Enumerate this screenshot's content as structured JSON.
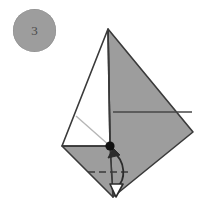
{
  "figure": {
    "type": "origami-instruction-diagram",
    "background_color": "#ffffff"
  },
  "step_badge": {
    "name": "step-number-badge",
    "number": "3",
    "fill_color": "#9d9d9d",
    "text_color": "#4a4a4a",
    "center_x": 34,
    "center_y": 30,
    "radius": 21
  },
  "colors": {
    "paper_front": "#9d9d9d",
    "paper_back": "#ffffff",
    "outline": "#3a3a3a",
    "crease_solid": "#4a4a4a",
    "crease_light": "#b0b0b0",
    "fold_dashed": "#3a3a3a",
    "arrow": "#2b2b2b",
    "point_marker": "#111111"
  },
  "geometry": {
    "apex": {
      "label": "top-vertex",
      "x": 108,
      "y": 29
    },
    "right_vertex": {
      "label": "right-vertex",
      "x": 193,
      "y": 132
    },
    "bottom_vertex": {
      "label": "bottom-vertex",
      "x": 113,
      "y": 197
    },
    "left_vertex": {
      "label": "left-vertex",
      "x": 62,
      "y": 146
    },
    "center_point": {
      "label": "center-point",
      "x": 110,
      "y": 146
    }
  },
  "shapes": {
    "gray_right_panel": {
      "name": "gray-right-panel",
      "points": "108,29 193,132 113,197 110,146"
    },
    "gray_bottom_left_panel": {
      "name": "gray-bottom-left-panel",
      "points": "62,146 110,146 113,197"
    },
    "white_left_panel": {
      "name": "white-left-panel",
      "points": "108,29 110,146 62,146"
    }
  },
  "creases": {
    "vertical_center": {
      "name": "vertical-center-crease",
      "x1": 108,
      "y1": 29,
      "x2": 110,
      "y2": 146
    },
    "horizontal_left": {
      "name": "horizontal-left-crease",
      "x1": 62,
      "y1": 146,
      "x2": 110,
      "y2": 146
    },
    "horizontal_right": {
      "name": "horizontal-right-crease",
      "x1": 113,
      "y1": 112,
      "x2": 192,
      "y2": 112
    },
    "diagonal_light": {
      "name": "diagonal-light-crease",
      "x1": 76,
      "y1": 116,
      "x2": 110,
      "y2": 146
    }
  },
  "fold_line": {
    "name": "valley-fold-dashed-line",
    "x1": 88,
    "y1": 172,
    "x2": 130,
    "y2": 172,
    "dash_pattern": "7 4"
  },
  "arrow": {
    "name": "fold-direction-arrow",
    "description": "curved arrow from center point down to bottom flap",
    "path": "M 112 151 C 124 160 124 180 116 188",
    "head_points": "110,186 122,186 116,196",
    "tail_head_points": "106,154 118,150 112,144"
  },
  "point_marker": {
    "name": "reference-point-dot",
    "x": 110,
    "y": 146,
    "radius": 4.5
  }
}
